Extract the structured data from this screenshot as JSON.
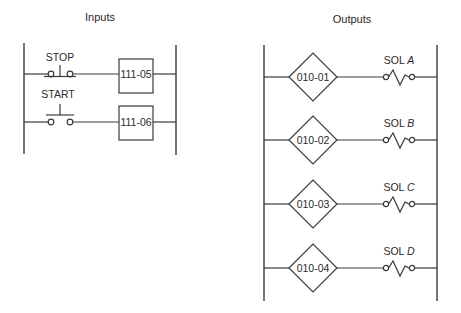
{
  "inputs": {
    "title": "Inputs",
    "rungs": [
      {
        "contact_label": "STOP",
        "contact_type": "normally-closed pushbutton",
        "address": "111-05"
      },
      {
        "contact_label": "START",
        "contact_type": "normally-open pushbutton",
        "address": "111-06"
      }
    ]
  },
  "outputs": {
    "title": "Outputs",
    "rungs": [
      {
        "address": "010-01",
        "load_prefix": "SOL",
        "load_letter": "A",
        "load_type": "solenoid"
      },
      {
        "address": "010-02",
        "load_prefix": "SOL",
        "load_letter": "B",
        "load_type": "solenoid"
      },
      {
        "address": "010-03",
        "load_prefix": "SOL",
        "load_letter": "C",
        "load_type": "solenoid"
      },
      {
        "address": "010-04",
        "load_prefix": "SOL",
        "load_letter": "D",
        "load_type": "solenoid"
      }
    ]
  },
  "colors": {
    "line": "#3a3a3a",
    "text": "#2a2a2a",
    "background": "#ffffff"
  }
}
